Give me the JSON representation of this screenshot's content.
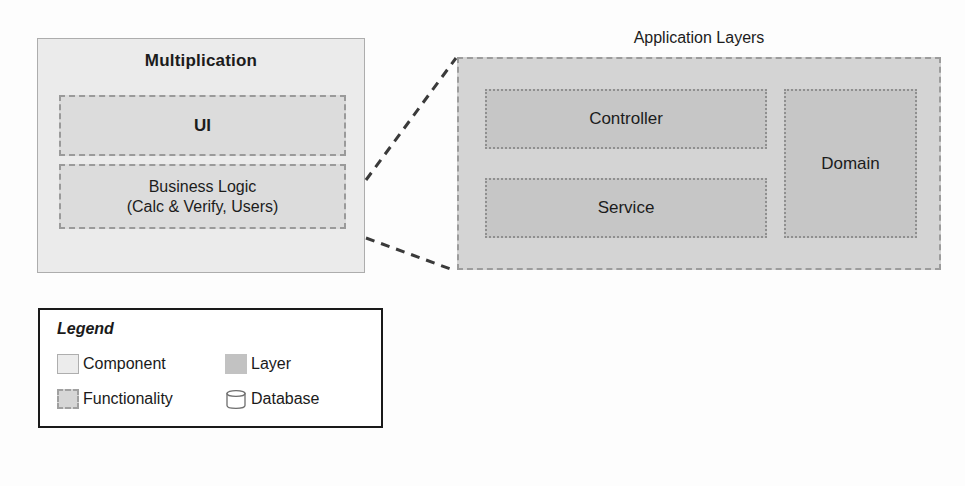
{
  "diagram": {
    "component": {
      "title": "Multiplication",
      "functionalities": [
        {
          "name": "ui",
          "label": "UI"
        },
        {
          "name": "business-logic",
          "line1": "Business Logic",
          "line2": "(Calc & Verify, Users)"
        }
      ]
    },
    "application_layers": {
      "title": "Application Layers",
      "layers": [
        {
          "name": "controller",
          "label": "Controller"
        },
        {
          "name": "service",
          "label": "Service"
        },
        {
          "name": "domain",
          "label": "Domain"
        }
      ]
    },
    "legend": {
      "title": "Legend",
      "items": [
        {
          "label": "Component",
          "swatch": "component-swatch-icon"
        },
        {
          "label": "Layer",
          "swatch": "layer-swatch-icon"
        },
        {
          "label": "Functionality",
          "swatch": "functionality-swatch-icon"
        },
        {
          "label": "Database",
          "swatch": "database-cylinder-icon"
        }
      ]
    },
    "colors": {
      "component_fill": "#ebebeb",
      "component_border": "#adadad",
      "functionality_fill": "#dcdcdc",
      "functionality_border": "#9a9a9a",
      "layer_container_fill": "#d4d4d4",
      "layer_fill": "#c6c6c6",
      "layer_border": "#8f8f8f",
      "connector": "#3a3a3a",
      "legend_border": "#1a1a1a",
      "text": "#1c1c1c"
    }
  }
}
